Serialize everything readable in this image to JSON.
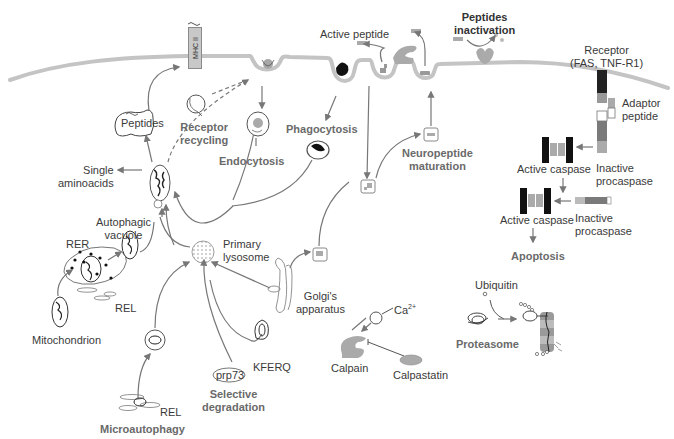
{
  "colors": {
    "membrane": "#c4c4c4",
    "arrow": "#777777",
    "text": "#3a3a3a",
    "bold_text": "#6a6a6a",
    "dark_block": "#1a1a1a",
    "mid_gray": "#8c8c8c",
    "light_gray": "#b8b8b8"
  },
  "membrane_proteins": {
    "mhc": "MHC II"
  },
  "labels": {
    "peptides_box": "Peptides",
    "receptor_recycling": [
      "Receptor",
      "recycling"
    ],
    "endocytosis": "Endocytosis",
    "phagocytosis": "Phagocytosis",
    "single_aminoacids": [
      "Single",
      "aminoacids"
    ],
    "autophagic_vacuole": [
      "Autophagic",
      "vacuole"
    ],
    "rer": "RER",
    "rel_top": "REL",
    "mitochondrion": "Mitochondrion",
    "primary_lysosome": [
      "Primary",
      "lysosome"
    ],
    "golgi": [
      "Golgi's",
      "apparatus"
    ],
    "kferq": "KFERQ",
    "prp73": "prp73",
    "selective_degradation": [
      "Selective",
      "degradation"
    ],
    "rel_bottom": "REL",
    "microautophagy": "Microautophagy",
    "active_peptide": "Active peptide",
    "peptides_inactivation": [
      "Peptides",
      "inactivation"
    ],
    "neuropeptide_maturation": [
      "Neuropeptide",
      "maturation"
    ],
    "receptor": [
      "Receptor",
      "(FAS, TNF-R1)"
    ],
    "adaptor_peptide": [
      "Adaptor",
      "peptide"
    ],
    "active_caspase_1": "Active caspase",
    "inactive_procaspase_1": [
      "Inactive",
      "procaspase"
    ],
    "active_caspase_2": "Active caspase",
    "inactive_procaspase_2": [
      "Inactive",
      "procaspase"
    ],
    "apoptosis": "Apoptosis",
    "ca": "Ca",
    "ca_sup": "2+",
    "plus": "+",
    "calpain": "Calpain",
    "calpastatin": "Calpastatin",
    "ubiquitin": "Ubiquitin",
    "proteasome": "Proteasome"
  }
}
